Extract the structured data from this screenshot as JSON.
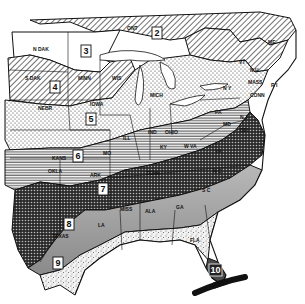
{
  "map": {
    "title": "Plant hardiness zones – eastern United States",
    "zones": [
      {
        "id": "2",
        "label": "2",
        "pattern": "diagonal-hatch"
      },
      {
        "id": "3",
        "label": "3",
        "pattern": "blank"
      },
      {
        "id": "4",
        "label": "4",
        "pattern": "diagonal-hatch"
      },
      {
        "id": "5",
        "label": "5",
        "pattern": "dots"
      },
      {
        "id": "6",
        "label": "6",
        "pattern": "horizontal-lines"
      },
      {
        "id": "7",
        "label": "7",
        "pattern": "crosshatch-dark"
      },
      {
        "id": "8",
        "label": "8",
        "pattern": "gray-tone"
      },
      {
        "id": "9",
        "label": "9",
        "pattern": "light-stipple"
      },
      {
        "id": "10",
        "label": "10",
        "pattern": "dark-vertical"
      }
    ],
    "states": {
      "ont": "ONT",
      "ndak": "N DAK",
      "sdak": "S DAK",
      "nebr": "NEBR",
      "minn": "MINN",
      "wis": "WIS",
      "iowa": "IOWA",
      "mich": "MICH",
      "kans": "KANS",
      "mo": "MO",
      "ill": "ILL",
      "ind": "IND",
      "ohio": "OHIO",
      "ky": "KY",
      "wva": "W VA",
      "va": "VA",
      "pa": "PA",
      "ny": "N Y",
      "vt": "VT",
      "nh": "N H",
      "me": "ME",
      "mass": "MASS",
      "ri": "R I",
      "conn": "CONN",
      "nj": "N J",
      "del": "DEL",
      "md": "MD",
      "okla": "OKLA",
      "ark": "ARK",
      "tenn": "TENN",
      "nc": "N C",
      "sc": "S C",
      "ga": "GA",
      "ala": "ALA",
      "miss": "MISS",
      "la": "LA",
      "texas": "TEXAS",
      "fla": "FLA"
    }
  }
}
